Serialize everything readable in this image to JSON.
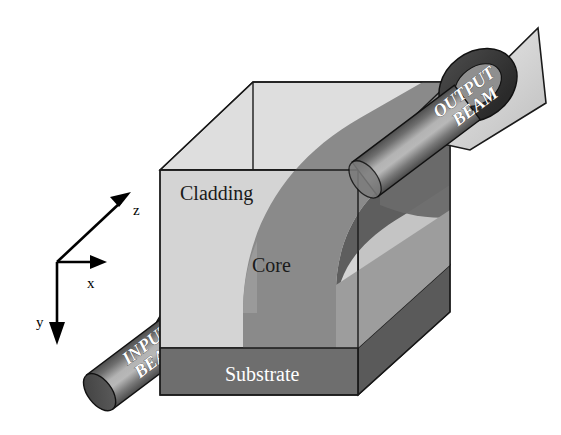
{
  "figure": {
    "background_color": "#ffffff"
  },
  "axes": {
    "name": "coordinate-axes",
    "origin": {
      "x": 57,
      "y": 262
    },
    "labels": {
      "z": "z",
      "x": "x",
      "y": "y"
    },
    "color": "#000000"
  },
  "structure": {
    "layers": [
      {
        "id": "cladding",
        "label": "Cladding",
        "label_color": "#000000",
        "face_color": "#d4d4d4",
        "top_color": "#dcdcdc",
        "side_color": "#b9b9b9"
      },
      {
        "id": "core",
        "label": "Core",
        "label_color": "#000000",
        "top_color": "#848484",
        "side_color": "#606060"
      },
      {
        "id": "substrate",
        "label": "Substrate",
        "label_color": "#ffffff",
        "face_color": "#6e6e6e",
        "side_color": "#585858"
      }
    ],
    "outline_color": "#1a1a1a"
  },
  "beams": [
    {
      "id": "input-beam",
      "label_line1": "INPUT",
      "label_line2": "BEAM",
      "label_color": "#ffffff",
      "body_color": "#6b6b6b",
      "highlight_color": "#a6a6a6",
      "cap_color": "#4a4a4a",
      "ring_color": "#3c3c3c",
      "wedge_color": "#c9c9c9",
      "angle_deg": -37
    },
    {
      "id": "output-beam",
      "label_line1": "OUTPUT",
      "label_line2": "BEAM",
      "label_color": "#ffffff",
      "body_color": "#6b6b6b",
      "highlight_color": "#a6a6a6",
      "cap_color": "#4a4a4a",
      "ring_color": "#3c3c3c",
      "wedge_color": "#c9c9c9",
      "angle_deg": -37
    }
  ]
}
